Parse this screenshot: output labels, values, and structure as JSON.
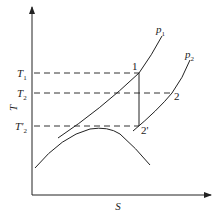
{
  "diagram": {
    "type": "T-S diagram",
    "axes": {
      "y_label": "T",
      "x_label": "S"
    },
    "levels": [
      {
        "id": "T1",
        "main": "T",
        "sub": "1"
      },
      {
        "id": "T2",
        "main": "T",
        "sub": "2"
      },
      {
        "id": "T2prime",
        "main": "T'",
        "sub": "2"
      }
    ],
    "isobars": [
      {
        "id": "p1",
        "main": "p",
        "sub": "1"
      },
      {
        "id": "p2",
        "main": "p",
        "sub": "2"
      }
    ],
    "points": [
      {
        "id": "1",
        "label": "1"
      },
      {
        "id": "2",
        "label": "2"
      },
      {
        "id": "2prime",
        "label": "2'"
      }
    ],
    "colors": {
      "line": "#222222",
      "dash": "#333333",
      "background": "#ffffff"
    }
  }
}
